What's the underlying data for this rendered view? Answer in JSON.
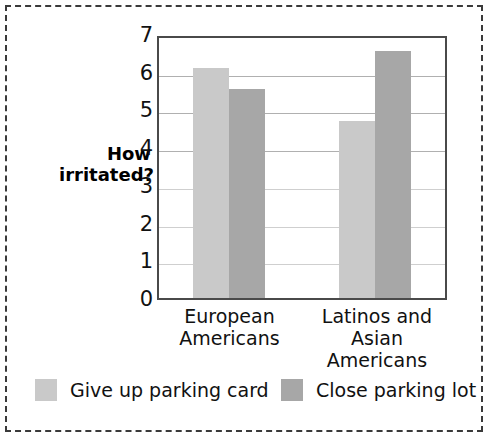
{
  "chart_data": {
    "type": "bar",
    "title": "",
    "subtitle": "",
    "xlabel": "",
    "ylabel": "How irritated?",
    "ylabel_lines": [
      "How",
      "irritated?"
    ],
    "categories": [
      "European Americans",
      "Latinos and Asian Americans"
    ],
    "category_lines": [
      [
        "European",
        "Americans"
      ],
      [
        "Latinos and Asian",
        "Americans"
      ]
    ],
    "series": [
      {
        "name": "Give up parking card",
        "color": "#c9c9c9",
        "values": [
          6.1,
          4.7
        ]
      },
      {
        "name": "Close parking lot",
        "color": "#a7a7a7",
        "values": [
          5.55,
          6.55
        ]
      }
    ],
    "ylim": [
      0,
      7
    ],
    "ytick_values": [
      0,
      1,
      2,
      3,
      4,
      5,
      6,
      7
    ],
    "ytick_labels": [
      "0",
      "1",
      "2",
      "3",
      "4",
      "5",
      "6",
      "7"
    ],
    "grid": true,
    "grid_axis": "y",
    "legend_position": "bottom",
    "legend": [
      {
        "label": "Give up parking card",
        "color": "#c9c9c9"
      },
      {
        "label": "Close parking lot",
        "color": "#a7a7a7"
      }
    ],
    "colors": {
      "light_bar": "#c9c9c9",
      "dark_bar": "#a7a7a7",
      "axis": "#4a4a4a",
      "gridline": "#b0b0b0",
      "text": "#111111",
      "frame_dash": "#3a3a3a"
    }
  }
}
